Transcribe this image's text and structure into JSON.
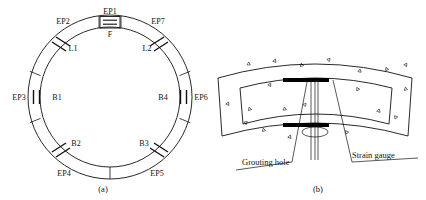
{
  "figure": {
    "panels": [
      {
        "id": "a",
        "caption": "(a)",
        "caption_x": 103,
        "caption_y": 192
      },
      {
        "id": "b",
        "caption": "(b)",
        "caption_x": 318,
        "caption_y": 192
      }
    ]
  },
  "ring_diagram": {
    "name": "segmental-tunnel-lining-ring",
    "center": {
      "cx": 110,
      "cy": 97
    },
    "outer_radius": 82,
    "inner_radius": 70,
    "segments": [
      {
        "label": "F",
        "type": "key-segment",
        "angle_start": -99,
        "angle_end": -81
      },
      {
        "label": "L1",
        "type": "adjacent-segment",
        "angle_start": -168,
        "angle_end": -99
      },
      {
        "label": "L2",
        "type": "adjacent-segment",
        "angle_start": -81,
        "angle_end": -12
      },
      {
        "label": "B1",
        "type": "standard-segment",
        "angle_start": 132,
        "angle_end": 192
      },
      {
        "label": "B2",
        "type": "standard-segment",
        "angle_start": 90,
        "angle_end": 132
      },
      {
        "label": "B3",
        "type": "standard-segment",
        "angle_start": 48,
        "angle_end": 90
      },
      {
        "label": "B4",
        "type": "standard-segment",
        "angle_start": -12,
        "angle_end": 48
      }
    ],
    "segment_labels": [
      {
        "text": "F",
        "x": 110,
        "y": 37,
        "anchor": "middle"
      },
      {
        "text": "L1",
        "x": 73,
        "y": 51,
        "anchor": "middle"
      },
      {
        "text": "L2",
        "x": 147,
        "y": 51,
        "anchor": "middle"
      },
      {
        "text": "B1",
        "x": 57,
        "y": 100,
        "anchor": "middle"
      },
      {
        "text": "B4",
        "x": 163,
        "y": 100,
        "anchor": "middle"
      },
      {
        "text": "B2",
        "x": 76,
        "y": 146,
        "anchor": "middle"
      },
      {
        "text": "B3",
        "x": 144,
        "y": 146,
        "anchor": "middle"
      }
    ],
    "measurement_points": [
      {
        "text": "EP1",
        "x": 110,
        "y": 14,
        "anchor": "middle",
        "marker": "key-hatch",
        "angle": -90
      },
      {
        "text": "EP2",
        "x": 63,
        "y": 24,
        "anchor": "middle",
        "marker": "diagonal-pair",
        "angle": -135
      },
      {
        "text": "EP7",
        "x": 158,
        "y": 24,
        "anchor": "middle",
        "marker": "diagonal-pair",
        "angle": -45
      },
      {
        "text": "EP3",
        "x": 19,
        "y": 100,
        "anchor": "middle",
        "marker": "vertical-pair",
        "angle": 180
      },
      {
        "text": "EP6",
        "x": 201,
        "y": 100,
        "anchor": "middle",
        "marker": "vertical-pair",
        "angle": 0
      },
      {
        "text": "EP4",
        "x": 64,
        "y": 176,
        "anchor": "middle",
        "marker": "diagonal-pair",
        "angle": 135
      },
      {
        "text": "EP5",
        "x": 157,
        "y": 176,
        "anchor": "middle",
        "marker": "diagonal-pair",
        "angle": 45
      }
    ]
  },
  "segment_detail": {
    "name": "curved-segment-cross-section",
    "annotations": [
      {
        "text": "Grouting hole",
        "x": 242,
        "y": 165,
        "anchor": "start"
      },
      {
        "text": "Strain gauge",
        "x": 352,
        "y": 165,
        "anchor": "start"
      }
    ],
    "strain_gauge_bars": [
      {
        "x": 283,
        "y": 78,
        "w": 46,
        "h": 4
      },
      {
        "x": 283,
        "y": 123,
        "w": 46,
        "h": 4
      }
    ],
    "grouting_hole_ellipse": {
      "cx": 315,
      "cy": 132,
      "rx": 13,
      "ry": 5
    }
  },
  "colors": {
    "line": "#111111",
    "fill_gauge": "#000000",
    "background": "#ffffff"
  }
}
